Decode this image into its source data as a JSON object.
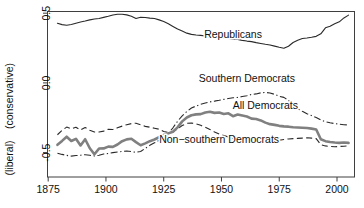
{
  "chart_data": {
    "type": "line",
    "title": "",
    "xlabel": "",
    "ylabel_top": "(conservative)",
    "ylabel_bottom": "(liberal)",
    "grid": false,
    "legend_position": "inline-annotations",
    "xlim": [
      1879,
      2006
    ],
    "ylim": [
      -0.62,
      0.55
    ],
    "xticks": [
      1875,
      1900,
      1925,
      1950,
      1975,
      2000
    ],
    "xticklabels": [
      "1875",
      "1900",
      "1925",
      "1950",
      "1975",
      "2000"
    ],
    "yticks": [
      0.5,
      0.0,
      -0.5
    ],
    "yticklabels": [
      "0.5",
      "0.0",
      "-0.5"
    ],
    "series": [
      {
        "name": "Republicans",
        "label": "Republicans",
        "style": "solid-thin-black",
        "color": "#2a2a2a",
        "x": [
          1879,
          1881,
          1883,
          1885,
          1887,
          1889,
          1891,
          1893,
          1895,
          1897,
          1899,
          1901,
          1903,
          1905,
          1907,
          1909,
          1911,
          1913,
          1915,
          1917,
          1919,
          1921,
          1923,
          1925,
          1927,
          1929,
          1931,
          1933,
          1935,
          1937,
          1939,
          1941,
          1943,
          1945,
          1947,
          1949,
          1951,
          1953,
          1955,
          1957,
          1959,
          1961,
          1963,
          1965,
          1967,
          1969,
          1971,
          1973,
          1975,
          1977,
          1979,
          1981,
          1983,
          1985,
          1987,
          1989,
          1991,
          1993,
          1995,
          1997,
          1999,
          2001,
          2003,
          2005
        ],
        "y": [
          0.428,
          0.418,
          0.414,
          0.419,
          0.428,
          0.437,
          0.444,
          0.452,
          0.458,
          0.462,
          0.47,
          0.478,
          0.487,
          0.493,
          0.492,
          0.488,
          0.478,
          0.462,
          0.471,
          0.469,
          0.465,
          0.462,
          0.452,
          0.44,
          0.424,
          0.405,
          0.386,
          0.372,
          0.357,
          0.348,
          0.344,
          0.341,
          0.336,
          0.328,
          0.33,
          0.325,
          0.322,
          0.318,
          0.314,
          0.312,
          0.305,
          0.3,
          0.296,
          0.289,
          0.283,
          0.277,
          0.272,
          0.264,
          0.256,
          0.249,
          0.263,
          0.29,
          0.306,
          0.318,
          0.322,
          0.327,
          0.334,
          0.352,
          0.395,
          0.406,
          0.424,
          0.438,
          0.466,
          0.486
        ]
      },
      {
        "name": "All Democrats",
        "label": "All Democrats",
        "style": "solid-thick-gray",
        "color": "#808080",
        "x": [
          1879,
          1881,
          1883,
          1885,
          1887,
          1889,
          1891,
          1893,
          1895,
          1897,
          1899,
          1901,
          1903,
          1905,
          1907,
          1909,
          1911,
          1913,
          1915,
          1917,
          1919,
          1921,
          1923,
          1925,
          1927,
          1929,
          1931,
          1933,
          1935,
          1937,
          1939,
          1941,
          1943,
          1945,
          1947,
          1949,
          1951,
          1953,
          1955,
          1957,
          1959,
          1961,
          1963,
          1965,
          1967,
          1969,
          1971,
          1973,
          1975,
          1977,
          1979,
          1981,
          1983,
          1985,
          1987,
          1989,
          1991,
          1993,
          1995,
          1997,
          1999,
          2001,
          2003,
          2005
        ],
        "y": [
          -0.444,
          -0.416,
          -0.386,
          -0.417,
          -0.401,
          -0.449,
          -0.404,
          -0.469,
          -0.512,
          -0.471,
          -0.47,
          -0.457,
          -0.459,
          -0.442,
          -0.418,
          -0.405,
          -0.401,
          -0.425,
          -0.447,
          -0.434,
          -0.418,
          -0.406,
          -0.39,
          -0.374,
          -0.362,
          -0.35,
          -0.319,
          -0.276,
          -0.248,
          -0.232,
          -0.226,
          -0.224,
          -0.212,
          -0.207,
          -0.215,
          -0.212,
          -0.223,
          -0.218,
          -0.239,
          -0.227,
          -0.234,
          -0.241,
          -0.256,
          -0.259,
          -0.269,
          -0.285,
          -0.296,
          -0.301,
          -0.308,
          -0.312,
          -0.314,
          -0.318,
          -0.32,
          -0.322,
          -0.324,
          -0.328,
          -0.334,
          -0.404,
          -0.418,
          -0.424,
          -0.428,
          -0.43,
          -0.428,
          -0.43
        ]
      },
      {
        "name": "Southern Democrats",
        "label": "Southern Democrats",
        "style": "dash-dot-black",
        "color": "#2a2a2a",
        "x": [
          1879,
          1881,
          1883,
          1885,
          1887,
          1889,
          1891,
          1893,
          1895,
          1897,
          1899,
          1901,
          1903,
          1905,
          1907,
          1909,
          1911,
          1913,
          1915,
          1917,
          1919,
          1921,
          1923,
          1925,
          1927,
          1929,
          1931,
          1933,
          1935,
          1937,
          1939,
          1941,
          1943,
          1945,
          1947,
          1949,
          1951,
          1953,
          1955,
          1957,
          1959,
          1961,
          1963,
          1965,
          1967,
          1969,
          1971,
          1973,
          1975,
          1977,
          1979,
          1981,
          1983,
          1985,
          1987,
          1989,
          1991,
          1993,
          1995,
          1997,
          1999,
          2001,
          2003,
          2005
        ],
        "y": [
          -0.504,
          -0.513,
          -0.52,
          -0.525,
          -0.521,
          -0.519,
          -0.515,
          -0.519,
          -0.524,
          -0.519,
          -0.51,
          -0.506,
          -0.5,
          -0.496,
          -0.492,
          -0.489,
          -0.493,
          -0.498,
          -0.492,
          -0.47,
          -0.448,
          -0.43,
          -0.412,
          -0.392,
          -0.362,
          -0.322,
          -0.275,
          -0.236,
          -0.205,
          -0.18,
          -0.166,
          -0.154,
          -0.144,
          -0.136,
          -0.131,
          -0.125,
          -0.118,
          -0.112,
          -0.107,
          -0.104,
          -0.098,
          -0.092,
          -0.083,
          -0.079,
          -0.071,
          -0.068,
          -0.072,
          -0.082,
          -0.096,
          -0.104,
          -0.124,
          -0.163,
          -0.186,
          -0.204,
          -0.221,
          -0.234,
          -0.248,
          -0.266,
          -0.278,
          -0.286,
          -0.292,
          -0.296,
          -0.3,
          -0.302
        ]
      },
      {
        "name": "Non-southern Democrats",
        "label": "Non−southern Democrats",
        "style": "dashed-black",
        "color": "#2a2a2a",
        "x": [
          1879,
          1881,
          1883,
          1885,
          1887,
          1889,
          1891,
          1893,
          1895,
          1897,
          1899,
          1901,
          1903,
          1905,
          1907,
          1909,
          1911,
          1913,
          1915,
          1917,
          1919,
          1921,
          1923,
          1925,
          1927,
          1929,
          1931,
          1933,
          1935,
          1937,
          1939,
          1941,
          1943,
          1945,
          1947,
          1949,
          1951,
          1953,
          1955,
          1957,
          1959,
          1961,
          1963,
          1965,
          1967,
          1969,
          1971,
          1973,
          1975,
          1977,
          1979,
          1981,
          1983,
          1985,
          1987,
          1989,
          1991,
          1993,
          1995,
          1997,
          1999,
          2001,
          2003,
          2005
        ],
        "y": [
          -0.372,
          -0.34,
          -0.317,
          -0.33,
          -0.318,
          -0.338,
          -0.32,
          -0.34,
          -0.352,
          -0.352,
          -0.346,
          -0.332,
          -0.334,
          -0.322,
          -0.31,
          -0.3,
          -0.292,
          -0.289,
          -0.3,
          -0.312,
          -0.318,
          -0.325,
          -0.332,
          -0.348,
          -0.356,
          -0.35,
          -0.33,
          -0.306,
          -0.29,
          -0.288,
          -0.294,
          -0.304,
          -0.318,
          -0.334,
          -0.352,
          -0.366,
          -0.378,
          -0.388,
          -0.396,
          -0.4,
          -0.404,
          -0.406,
          -0.404,
          -0.402,
          -0.4,
          -0.404,
          -0.406,
          -0.408,
          -0.412,
          -0.406,
          -0.402,
          -0.4,
          -0.398,
          -0.396,
          -0.394,
          -0.396,
          -0.4,
          -0.444,
          -0.452,
          -0.456,
          -0.458,
          -0.456,
          -0.454,
          -0.452
        ]
      }
    ],
    "annotations": [
      {
        "text": "Republicans",
        "x": 1955,
        "y": 0.325
      },
      {
        "text": "Southern Democrats",
        "x": 1961,
        "y": 0.01
      },
      {
        "text": "All Democrats",
        "x": 1969,
        "y": -0.185
      },
      {
        "text": "Non−southern Democrats",
        "x": 1949,
        "y": -0.432
      }
    ]
  }
}
